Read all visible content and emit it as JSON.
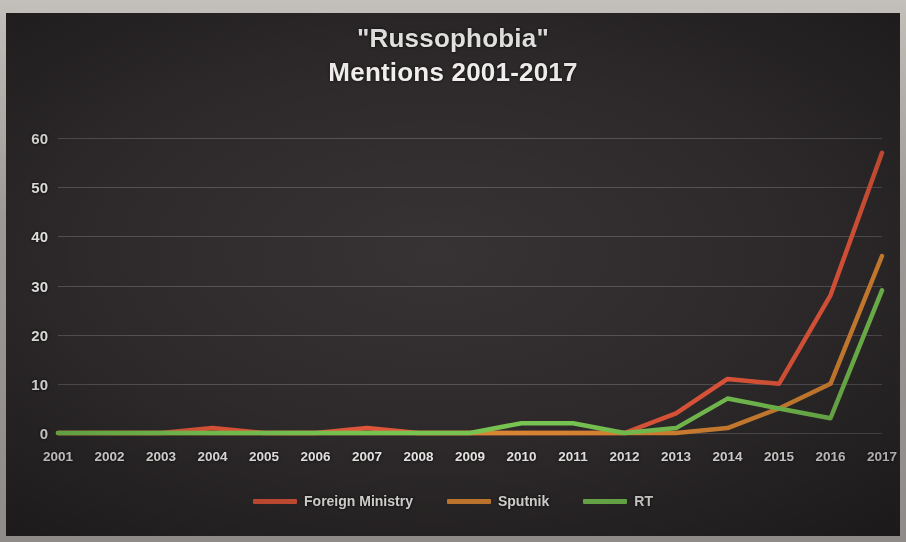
{
  "chart_data": {
    "type": "line",
    "title": "\"Russophobia\"",
    "title_line2": "Mentions 2001-2017",
    "xlabel": "",
    "ylabel": "",
    "ylim": [
      0,
      60
    ],
    "yticks": [
      0,
      10,
      20,
      30,
      40,
      50,
      60
    ],
    "grid": true,
    "legend_position": "bottom",
    "categories": [
      "2001",
      "2002",
      "2003",
      "2004",
      "2005",
      "2006",
      "2007",
      "2008",
      "2009",
      "2010",
      "2011",
      "2012",
      "2013",
      "2014",
      "2015",
      "2016",
      "2017"
    ],
    "series": [
      {
        "name": "Foreign Ministry",
        "color": "#E0563A",
        "values": [
          0,
          0,
          0,
          1,
          0,
          0,
          1,
          0,
          0,
          0,
          0,
          0,
          4,
          11,
          10,
          28,
          57
        ]
      },
      {
        "name": "Sputnik",
        "color": "#D98634",
        "values": [
          0,
          0,
          0,
          0,
          0,
          0,
          0,
          0,
          0,
          0,
          0,
          0,
          0,
          1,
          5,
          10,
          36
        ]
      },
      {
        "name": "RT",
        "color": "#78C352",
        "values": [
          0,
          0,
          0,
          0,
          0,
          0,
          0,
          0,
          0,
          2,
          2,
          0,
          1,
          7,
          5,
          3,
          29
        ]
      }
    ]
  },
  "legend": {
    "items": [
      {
        "label": "Foreign Ministry",
        "color": "#E0563A"
      },
      {
        "label": "Sputnik",
        "color": "#D98634"
      },
      {
        "label": "RT",
        "color": "#78C352"
      }
    ]
  },
  "theme": {
    "background": "#2e2a2b",
    "text": "#efeeec",
    "gridline": "rgba(225,222,230,0.22)"
  }
}
